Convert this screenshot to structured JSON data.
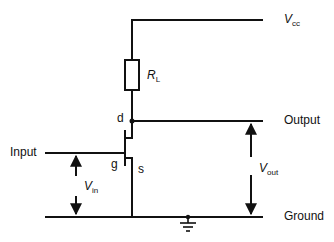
{
  "diagram": {
    "type": "circuit-schematic",
    "colors": {
      "wire": "#111111",
      "background": "#ffffff"
    },
    "nodes": {
      "vcc": {
        "symbol": "V",
        "subscript": "cc"
      },
      "output": {
        "label": "Output"
      },
      "input": {
        "label": "Input"
      },
      "ground": {
        "label": "Ground"
      }
    },
    "components": {
      "load_resistor": {
        "symbol": "R",
        "subscript": "L"
      },
      "transistor": {
        "type": "FET",
        "terminals": {
          "drain": "d",
          "gate": "g",
          "source": "s"
        }
      },
      "ground_symbol": {
        "icon": "ground-icon"
      }
    },
    "voltages": {
      "vin": {
        "symbol": "V",
        "subscript": "in"
      },
      "vout": {
        "symbol": "V",
        "subscript": "out"
      }
    }
  }
}
